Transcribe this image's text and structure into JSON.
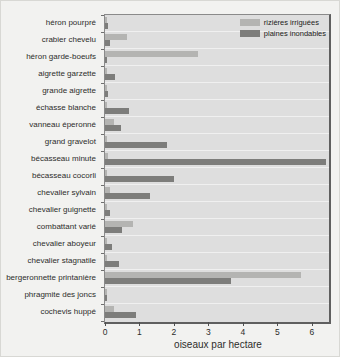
{
  "chart_data": {
    "type": "bar",
    "orientation": "horizontal",
    "title": "",
    "xlabel": "oiseaux par hectare",
    "xlim": [
      0,
      6.5
    ],
    "xticks": [
      "0",
      "1",
      "2",
      "3",
      "4",
      "5",
      "6"
    ],
    "grid": "horizontal category separator lines",
    "legend_position": "top-right inside plot",
    "categories": [
      "héron pourpré",
      "crabier chevelu",
      "héron garde-boeufs",
      "aigrette garzette",
      "grande aigrette",
      "échasse blanche",
      "vanneau éperonné",
      "grand gravelot",
      "bécasseau minute",
      "bécasseau cocorli",
      "chevalier sylvain",
      "chevalier guignette",
      "combattant varié",
      "chevalier aboyeur",
      "chevalier stagnatile",
      "bergeronnette printanière",
      "phragmite des joncs",
      "cochevis huppé"
    ],
    "series": [
      {
        "name": "rizières irriguées",
        "color": "#b4b4b2",
        "values": [
          0.05,
          0.65,
          2.7,
          0.05,
          0.05,
          0.05,
          0.25,
          0.05,
          0.1,
          0.05,
          0.15,
          0.05,
          0.8,
          0.05,
          0.05,
          5.7,
          0.05,
          0.25
        ]
      },
      {
        "name": "plaines inondables",
        "color": "#7d7d7b",
        "values": [
          0.1,
          0.15,
          0.05,
          0.3,
          0.1,
          0.7,
          0.45,
          1.8,
          6.4,
          2.0,
          1.3,
          0.15,
          0.5,
          0.2,
          0.4,
          3.65,
          0.05,
          0.9
        ]
      }
    ]
  },
  "colors": {
    "plot_background": "#dedede",
    "outer_background": "#f2f2f0",
    "plot_border": "#5f5f5f",
    "text": "#2d2d2b",
    "separator_line": "#ececea"
  }
}
